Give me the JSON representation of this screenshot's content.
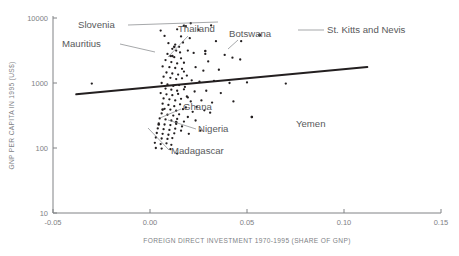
{
  "chart_data": {
    "type": "scatter",
    "title": "",
    "xlabel": "FOREIGN DIRECT INVESTMENT 1970-1995 (SHARE OF GNP)",
    "ylabel": "GNP PER CAPITA IN 1995 (US$)",
    "xlim": [
      -0.05,
      0.15
    ],
    "ylim": [
      10,
      10000
    ],
    "yscale": "log",
    "xscale": "linear",
    "grid": false,
    "legend": null,
    "xticks": [
      "-0.05",
      "0.00",
      "0.05",
      "0.10",
      "0.15"
    ],
    "xtick_values": [
      -0.05,
      0.0,
      0.05,
      0.1,
      0.15
    ],
    "yticks": [
      "10",
      "100",
      "1000",
      "10000"
    ],
    "ytick_values": [
      10,
      100,
      1000,
      10000
    ],
    "trendline": {
      "x": [
        -0.038,
        0.112
      ],
      "y": [
        670,
        1760
      ]
    },
    "annotations": [
      {
        "label": "Slovenia",
        "x": 0.0175,
        "y": 7600
      },
      {
        "label": "Mauritius",
        "x": 0.0125,
        "y": 3600
      },
      {
        "label": "Thailand",
        "x": 0.0115,
        "y": 2600
      },
      {
        "label": "Botswana",
        "x": 0.0285,
        "y": 3100
      },
      {
        "label": "St. Kitts and Nevis",
        "x": 0.0565,
        "y": 5500
      },
      {
        "label": "Ghana",
        "x": 0.0065,
        "y": 390
      },
      {
        "label": "Nigeria",
        "x": 0.0135,
        "y": 250
      },
      {
        "label": "Madagascar",
        "x": 0.0045,
        "y": 230
      },
      {
        "label": "Yemen",
        "x": 0.0525,
        "y": 300
      }
    ],
    "points": [
      [
        0.0055,
        6400
      ],
      [
        0.014,
        6700
      ],
      [
        0.0185,
        7500
      ],
      [
        0.021,
        8300
      ],
      [
        0.025,
        6600
      ],
      [
        0.0315,
        7700
      ],
      [
        0.0075,
        5300
      ],
      [
        0.016,
        5200
      ],
      [
        0.0205,
        4900
      ],
      [
        0.034,
        4400
      ],
      [
        0.047,
        4400
      ],
      [
        0.0565,
        5400
      ],
      [
        0.0095,
        4100
      ],
      [
        0.013,
        3900
      ],
      [
        0.015,
        3600
      ],
      [
        0.017,
        4200
      ],
      [
        0.0115,
        3350
      ],
      [
        0.0135,
        3150
      ],
      [
        0.0155,
        2950
      ],
      [
        0.0195,
        3150
      ],
      [
        0.0225,
        2900
      ],
      [
        0.0285,
        2800
      ],
      [
        0.03,
        2150
      ],
      [
        0.0385,
        2700
      ],
      [
        0.0425,
        2450
      ],
      [
        0.0465,
        2300
      ],
      [
        0.009,
        2800
      ],
      [
        0.0105,
        2600
      ],
      [
        0.0125,
        2500
      ],
      [
        0.016,
        2400
      ],
      [
        0.008,
        2250
      ],
      [
        0.011,
        2100
      ],
      [
        0.014,
        2000
      ],
      [
        0.0175,
        2050
      ],
      [
        0.0065,
        1800
      ],
      [
        0.01,
        1750
      ],
      [
        0.013,
        1700
      ],
      [
        0.0165,
        1650
      ],
      [
        0.0235,
        1750
      ],
      [
        0.0275,
        1550
      ],
      [
        0.0355,
        1600
      ],
      [
        0.0085,
        1450
      ],
      [
        0.0115,
        1400
      ],
      [
        0.0145,
        1350
      ],
      [
        0.019,
        1300
      ],
      [
        0.007,
        1250
      ],
      [
        0.0105,
        1200
      ],
      [
        0.0135,
        1150
      ],
      [
        0.0165,
        1180
      ],
      [
        0.0215,
        1100
      ],
      [
        0.0255,
        1050
      ],
      [
        0.033,
        1080
      ],
      [
        0.041,
        1000
      ],
      [
        0.05,
        1020
      ],
      [
        0.07,
        980
      ],
      [
        -0.03,
        980
      ],
      [
        0.006,
        1000
      ],
      [
        0.009,
        950
      ],
      [
        0.012,
        900
      ],
      [
        0.015,
        930
      ],
      [
        0.018,
        870
      ],
      [
        0.008,
        820
      ],
      [
        0.011,
        790
      ],
      [
        0.014,
        760
      ],
      [
        0.0175,
        800
      ],
      [
        0.023,
        740
      ],
      [
        0.029,
        760
      ],
      [
        0.0365,
        700
      ],
      [
        0.0055,
        700
      ],
      [
        0.0085,
        670
      ],
      [
        0.0115,
        650
      ],
      [
        0.0145,
        680
      ],
      [
        0.019,
        620
      ],
      [
        0.007,
        580
      ],
      [
        0.01,
        560
      ],
      [
        0.013,
        540
      ],
      [
        0.016,
        570
      ],
      [
        0.021,
        520
      ],
      [
        0.0265,
        540
      ],
      [
        0.032,
        500
      ],
      [
        0.043,
        520
      ],
      [
        0.0065,
        480
      ],
      [
        0.0095,
        460
      ],
      [
        0.0125,
        440
      ],
      [
        0.0155,
        470
      ],
      [
        0.0185,
        420
      ],
      [
        0.0075,
        400
      ],
      [
        0.0105,
        390
      ],
      [
        0.0135,
        375
      ],
      [
        0.017,
        395
      ],
      [
        0.022,
        360
      ],
      [
        0.028,
        380
      ],
      [
        0.006,
        340
      ],
      [
        0.009,
        325
      ],
      [
        0.012,
        315
      ],
      [
        0.015,
        330
      ],
      [
        0.0195,
        300
      ],
      [
        0.0525,
        300
      ],
      [
        0.005,
        285
      ],
      [
        0.008,
        275
      ],
      [
        0.011,
        265
      ],
      [
        0.014,
        280
      ],
      [
        0.0175,
        255
      ],
      [
        0.0235,
        265
      ],
      [
        0.0045,
        240
      ],
      [
        0.0075,
        230
      ],
      [
        0.0105,
        225
      ],
      [
        0.0135,
        235
      ],
      [
        0.0165,
        215
      ],
      [
        0.004,
        200
      ],
      [
        0.007,
        195
      ],
      [
        0.01,
        190
      ],
      [
        0.013,
        198
      ],
      [
        0.016,
        185
      ],
      [
        0.0035,
        170
      ],
      [
        0.0065,
        165
      ],
      [
        0.0095,
        160
      ],
      [
        0.0125,
        168
      ],
      [
        0.003,
        145
      ],
      [
        0.006,
        140
      ],
      [
        0.009,
        138
      ],
      [
        0.0115,
        142
      ],
      [
        0.0025,
        120
      ],
      [
        0.0055,
        115
      ],
      [
        0.0085,
        118
      ],
      [
        0.011,
        112
      ],
      [
        0.003,
        100
      ],
      [
        0.006,
        98
      ],
      [
        0.0105,
        96
      ],
      [
        0.014,
        82
      ],
      [
        0.02,
        165
      ],
      [
        0.026,
        185
      ],
      [
        0.0195,
        600
      ],
      [
        0.024,
        430
      ],
      [
        0.031,
        350
      ],
      [
        0.0175,
        1500
      ]
    ]
  }
}
